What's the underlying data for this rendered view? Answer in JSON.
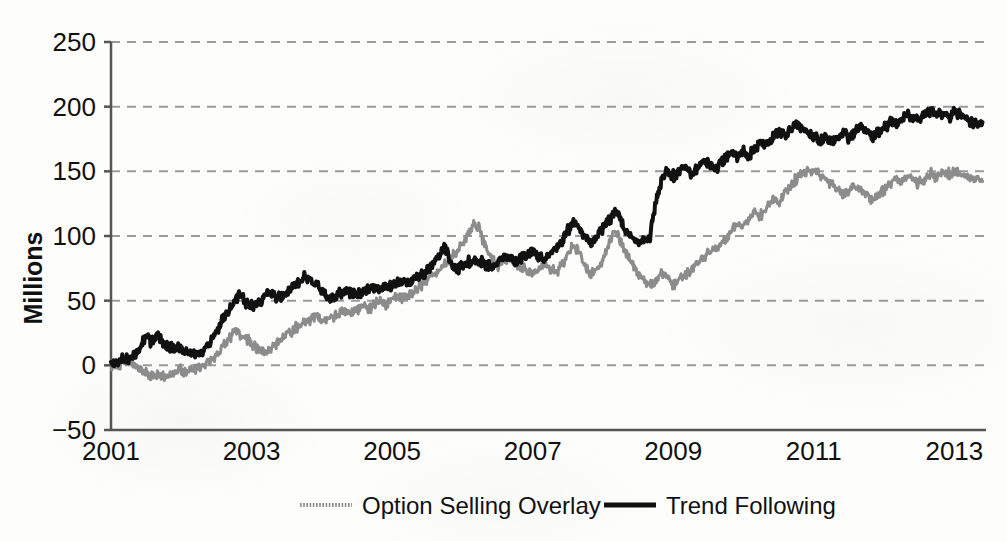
{
  "chart_data": {
    "type": "line",
    "title": "",
    "subtitle": "",
    "xlabel": "",
    "ylabel": "Millions",
    "xlim": [
      2001.0,
      2013.45
    ],
    "ylim": [
      -50,
      250
    ],
    "yticks": [
      -50,
      0,
      50,
      100,
      150,
      200,
      250
    ],
    "ytick_labels": [
      "−50",
      "0",
      "50",
      "100",
      "150",
      "200",
      "250"
    ],
    "xticks": [
      2001,
      2003,
      2005,
      2007,
      2009,
      2011,
      2013
    ],
    "xtick_labels": [
      "2001",
      "2003",
      "2005",
      "2007",
      "2009",
      "2011",
      "2013"
    ],
    "grid": true,
    "grid_style": "dashed",
    "grid_axis": "y",
    "legend_position": "bottom",
    "colors": {
      "option_selling_overlay": "#8c8c8c",
      "trend_following": "#111111",
      "gridline": "#9a9a9a",
      "axis": "#555555",
      "background": "#fdfdfc"
    },
    "series": [
      {
        "name": "Option Selling Overlay",
        "color": "#8c8c8c",
        "line_width": 3,
        "x": [
          2001.0,
          2001.08,
          2001.17,
          2001.25,
          2001.33,
          2001.42,
          2001.5,
          2001.58,
          2001.67,
          2001.75,
          2001.83,
          2001.92,
          2002.0,
          2002.08,
          2002.17,
          2002.25,
          2002.33,
          2002.42,
          2002.5,
          2002.58,
          2002.67,
          2002.75,
          2002.83,
          2002.92,
          2003.0,
          2003.08,
          2003.17,
          2003.25,
          2003.33,
          2003.42,
          2003.5,
          2003.58,
          2003.67,
          2003.75,
          2003.83,
          2003.92,
          2004.0,
          2004.08,
          2004.17,
          2004.25,
          2004.33,
          2004.42,
          2004.5,
          2004.58,
          2004.67,
          2004.75,
          2004.83,
          2004.92,
          2005.0,
          2005.08,
          2005.17,
          2005.25,
          2005.33,
          2005.42,
          2005.5,
          2005.58,
          2005.67,
          2005.75,
          2005.83,
          2005.92,
          2006.0,
          2006.08,
          2006.17,
          2006.25,
          2006.33,
          2006.42,
          2006.5,
          2006.58,
          2006.67,
          2006.75,
          2006.83,
          2006.92,
          2007.0,
          2007.08,
          2007.17,
          2007.25,
          2007.33,
          2007.42,
          2007.5,
          2007.58,
          2007.67,
          2007.75,
          2007.83,
          2007.92,
          2008.0,
          2008.08,
          2008.17,
          2008.25,
          2008.33,
          2008.42,
          2008.5,
          2008.58,
          2008.67,
          2008.75,
          2008.83,
          2008.92,
          2009.0,
          2009.08,
          2009.17,
          2009.25,
          2009.33,
          2009.42,
          2009.5,
          2009.58,
          2009.67,
          2009.75,
          2009.83,
          2009.92,
          2010.0,
          2010.08,
          2010.17,
          2010.25,
          2010.33,
          2010.42,
          2010.5,
          2010.58,
          2010.67,
          2010.75,
          2010.83,
          2010.92,
          2011.0,
          2011.08,
          2011.17,
          2011.25,
          2011.33,
          2011.42,
          2011.5,
          2011.58,
          2011.67,
          2011.75,
          2011.83,
          2011.92,
          2012.0,
          2012.08,
          2012.17,
          2012.25,
          2012.33,
          2012.42,
          2012.5,
          2012.58,
          2012.67,
          2012.75,
          2012.83,
          2012.92,
          2013.0,
          2013.1,
          2013.2,
          2013.3,
          2013.4
        ],
        "y": [
          0,
          1,
          3,
          2,
          -1,
          -3,
          -6,
          -8,
          -6,
          -9,
          -7,
          -5,
          -4,
          -6,
          -3,
          -2,
          0,
          3,
          8,
          14,
          20,
          26,
          24,
          20,
          17,
          13,
          10,
          12,
          16,
          20,
          24,
          28,
          31,
          33,
          36,
          38,
          36,
          34,
          37,
          40,
          42,
          40,
          43,
          46,
          44,
          47,
          50,
          48,
          51,
          54,
          52,
          55,
          58,
          62,
          66,
          70,
          74,
          78,
          82,
          88,
          94,
          102,
          110,
          104,
          92,
          83,
          76,
          80,
          84,
          80,
          76,
          73,
          70,
          74,
          78,
          74,
          72,
          78,
          86,
          94,
          86,
          76,
          70,
          74,
          82,
          92,
          104,
          96,
          86,
          78,
          70,
          66,
          62,
          66,
          72,
          68,
          62,
          66,
          70,
          74,
          78,
          82,
          86,
          90,
          94,
          98,
          104,
          110,
          108,
          112,
          118,
          116,
          122,
          128,
          126,
          132,
          138,
          144,
          148,
          150,
          150,
          148,
          144,
          140,
          136,
          132,
          136,
          140,
          136,
          132,
          128,
          132,
          136,
          140,
          144,
          142,
          146,
          144,
          140,
          144,
          148,
          146,
          150,
          148,
          150,
          148,
          146,
          144,
          142
        ]
      },
      {
        "name": "Trend Following",
        "color": "#111111",
        "line_width": 4,
        "x": [
          2001.0,
          2001.08,
          2001.17,
          2001.25,
          2001.33,
          2001.42,
          2001.5,
          2001.58,
          2001.67,
          2001.75,
          2001.83,
          2001.92,
          2002.0,
          2002.08,
          2002.17,
          2002.25,
          2002.33,
          2002.42,
          2002.5,
          2002.58,
          2002.67,
          2002.75,
          2002.83,
          2002.92,
          2003.0,
          2003.08,
          2003.17,
          2003.25,
          2003.33,
          2003.42,
          2003.5,
          2003.58,
          2003.67,
          2003.75,
          2003.83,
          2003.92,
          2004.0,
          2004.08,
          2004.17,
          2004.25,
          2004.33,
          2004.42,
          2004.5,
          2004.58,
          2004.67,
          2004.75,
          2004.83,
          2004.92,
          2005.0,
          2005.08,
          2005.17,
          2005.25,
          2005.33,
          2005.42,
          2005.5,
          2005.58,
          2005.67,
          2005.75,
          2005.83,
          2005.92,
          2006.0,
          2006.08,
          2006.17,
          2006.25,
          2006.33,
          2006.42,
          2006.5,
          2006.58,
          2006.67,
          2006.75,
          2006.83,
          2006.92,
          2007.0,
          2007.08,
          2007.17,
          2007.25,
          2007.33,
          2007.42,
          2007.5,
          2007.58,
          2007.67,
          2007.75,
          2007.83,
          2007.92,
          2008.0,
          2008.08,
          2008.17,
          2008.25,
          2008.33,
          2008.42,
          2008.5,
          2008.58,
          2008.67,
          2008.75,
          2008.83,
          2008.92,
          2009.0,
          2009.08,
          2009.17,
          2009.25,
          2009.33,
          2009.42,
          2009.5,
          2009.58,
          2009.67,
          2009.75,
          2009.83,
          2009.92,
          2010.0,
          2010.08,
          2010.17,
          2010.25,
          2010.33,
          2010.42,
          2010.5,
          2010.58,
          2010.67,
          2010.75,
          2010.83,
          2010.92,
          2011.0,
          2011.08,
          2011.17,
          2011.25,
          2011.33,
          2011.42,
          2011.5,
          2011.58,
          2011.67,
          2011.75,
          2011.83,
          2011.92,
          2012.0,
          2012.08,
          2012.17,
          2012.25,
          2012.33,
          2012.42,
          2012.5,
          2012.58,
          2012.67,
          2012.75,
          2012.83,
          2012.92,
          2013.0,
          2013.1,
          2013.2,
          2013.3,
          2013.4
        ],
        "y": [
          0,
          2,
          5,
          4,
          8,
          14,
          22,
          18,
          24,
          16,
          14,
          13,
          13,
          11,
          10,
          9,
          12,
          18,
          26,
          34,
          42,
          50,
          56,
          50,
          46,
          48,
          52,
          56,
          54,
          52,
          56,
          60,
          64,
          68,
          66,
          62,
          58,
          54,
          52,
          55,
          58,
          56,
          54,
          57,
          60,
          58,
          61,
          60,
          62,
          64,
          66,
          64,
          67,
          70,
          74,
          78,
          85,
          92,
          78,
          74,
          76,
          79,
          82,
          80,
          78,
          76,
          80,
          84,
          82,
          80,
          83,
          86,
          88,
          84,
          82,
          86,
          90,
          96,
          104,
          112,
          104,
          98,
          94,
          100,
          106,
          112,
          120,
          112,
          104,
          98,
          94,
          96,
          100,
          126,
          142,
          150,
          146,
          150,
          154,
          148,
          152,
          158,
          156,
          152,
          156,
          160,
          164,
          162,
          166,
          162,
          168,
          172,
          170,
          176,
          180,
          178,
          182,
          186,
          184,
          180,
          178,
          174,
          176,
          172,
          176,
          180,
          176,
          180,
          184,
          180,
          176,
          180,
          184,
          188,
          186,
          190,
          194,
          192,
          190,
          194,
          196,
          194,
          196,
          192,
          196,
          194,
          190,
          186,
          188
        ]
      }
    ]
  },
  "legend": {
    "items": [
      {
        "label": "Option Selling Overlay",
        "swatch": "gray-dotted-line",
        "color": "#8c8c8c"
      },
      {
        "label": "Trend Following",
        "swatch": "black-solid-line",
        "color": "#111111"
      }
    ]
  },
  "axes": {
    "y_title": "Millions",
    "y_tick_labels": [
      "250",
      "200",
      "150",
      "100",
      "50",
      "0",
      "−50"
    ],
    "x_tick_labels": [
      "2001",
      "2003",
      "2005",
      "2007",
      "2009",
      "2011",
      "2013"
    ]
  }
}
